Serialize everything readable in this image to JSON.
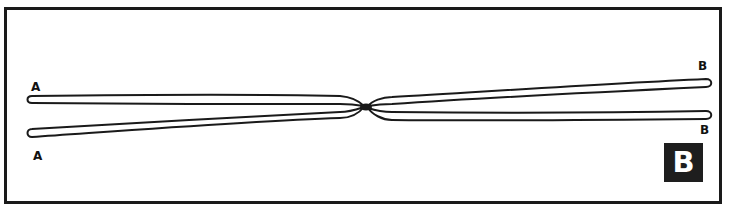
{
  "diagram": {
    "panel_label": "B",
    "arm_labels": {
      "left_top": "A",
      "left_bottom": "A",
      "right_top": "B",
      "right_bottom": "B"
    },
    "colors": {
      "stroke": "#1a1a1a",
      "badge_bg": "#1e1e1e",
      "badge_text": "#ffffff",
      "background": "#ffffff"
    }
  }
}
